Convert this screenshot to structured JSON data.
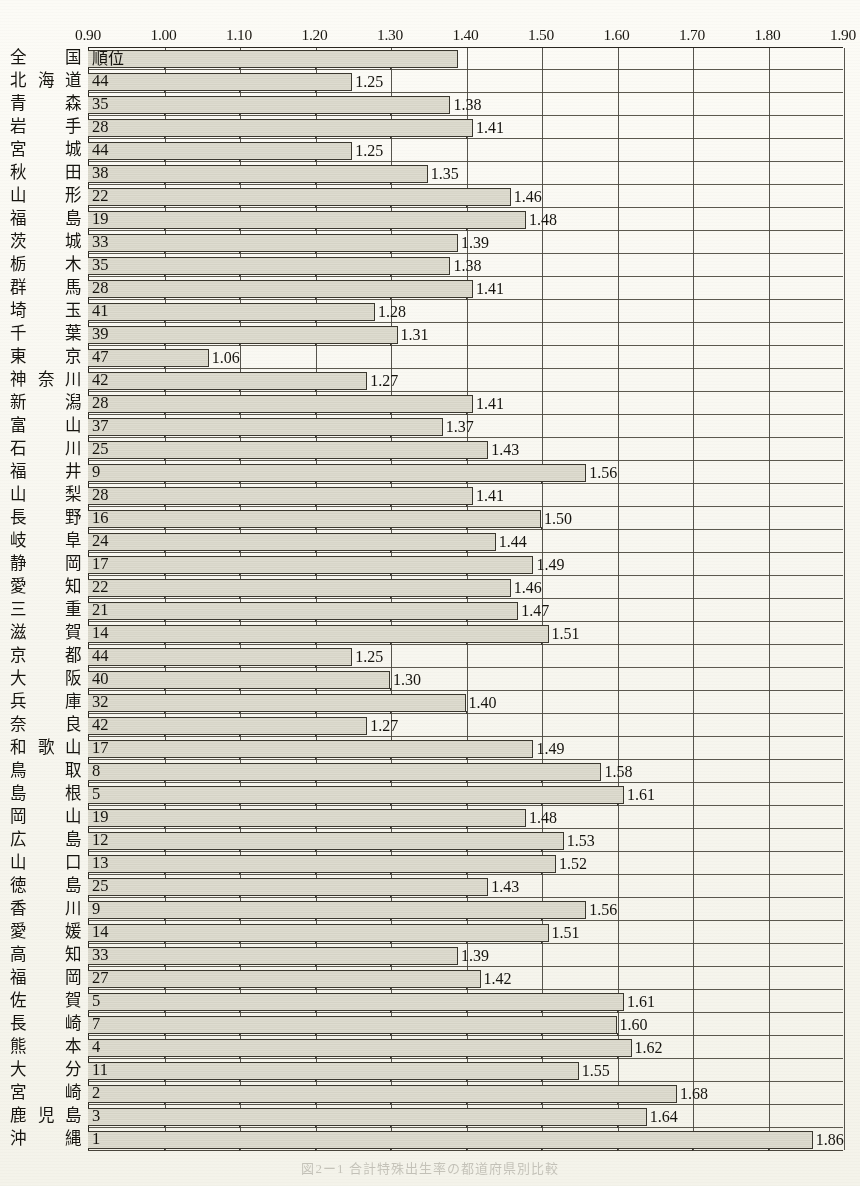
{
  "caption": "図2ー1 合計特殊出生率の都道府県別比較",
  "colors": {
    "bar_fill": "#dcdacd",
    "bar_stroke": "#3b382f",
    "axis": "#2a2720",
    "text": "#16140f",
    "paper": "#f7f6ef"
  },
  "rank_header_label": "順位",
  "chart_data": {
    "type": "bar",
    "orientation": "horizontal",
    "title": "",
    "xlabel": "",
    "ylabel": "",
    "xlim": [
      0.9,
      1.9
    ],
    "xticks": [
      "0.90",
      "1.00",
      "1.10",
      "1.20",
      "1.30",
      "1.40",
      "1.50",
      "1.60",
      "1.70",
      "1.80",
      "1.90"
    ],
    "xtick_values": [
      0.9,
      1.0,
      1.1,
      1.2,
      1.3,
      1.4,
      1.5,
      1.6,
      1.7,
      1.8,
      1.9
    ],
    "grid": true,
    "legend": "none",
    "categories": [
      "全国",
      "北海道",
      "青森",
      "岩手",
      "宮城",
      "秋田",
      "山形",
      "福島",
      "茨城",
      "栃木",
      "群馬",
      "埼玉",
      "千葉",
      "東京",
      "神奈川",
      "新潟",
      "富山",
      "石川",
      "福井",
      "山梨",
      "長野",
      "岐阜",
      "静岡",
      "愛知",
      "三重",
      "滋賀",
      "京都",
      "大阪",
      "兵庫",
      "奈良",
      "和歌山",
      "鳥取",
      "島根",
      "岡山",
      "広島",
      "山口",
      "徳島",
      "香川",
      "愛媛",
      "高知",
      "福岡",
      "佐賀",
      "長崎",
      "熊本",
      "大分",
      "宮崎",
      "鹿児島",
      "沖縄"
    ],
    "values": [
      1.39,
      1.25,
      1.38,
      1.41,
      1.25,
      1.35,
      1.46,
      1.48,
      1.39,
      1.38,
      1.41,
      1.28,
      1.31,
      1.06,
      1.27,
      1.41,
      1.37,
      1.43,
      1.56,
      1.41,
      1.5,
      1.44,
      1.49,
      1.46,
      1.47,
      1.51,
      1.25,
      1.3,
      1.4,
      1.27,
      1.49,
      1.58,
      1.61,
      1.48,
      1.53,
      1.52,
      1.43,
      1.56,
      1.51,
      1.39,
      1.42,
      1.61,
      1.6,
      1.62,
      1.55,
      1.68,
      1.64,
      1.86
    ],
    "ranks": [
      "順位",
      "44",
      "35",
      "28",
      "44",
      "38",
      "22",
      "19",
      "33",
      "35",
      "28",
      "41",
      "39",
      "47",
      "42",
      "28",
      "37",
      "25",
      "9",
      "28",
      "16",
      "24",
      "17",
      "22",
      "21",
      "14",
      "44",
      "40",
      "32",
      "42",
      "17",
      "8",
      "5",
      "19",
      "12",
      "13",
      "25",
      "9",
      "14",
      "33",
      "27",
      "5",
      "7",
      "4",
      "11",
      "2",
      "3",
      "1"
    ],
    "value_labels": [
      "1.39",
      "1.25",
      "1.38",
      "1.41",
      "1.25",
      "1.35",
      "1.46",
      "1.48",
      "1.39",
      "1.38",
      "1.41",
      "1.28",
      "1.31",
      "1.06",
      "1.27",
      "1.41",
      "1.37",
      "1.43",
      "1.56",
      "1.41",
      "1.50",
      "1.44",
      "1.49",
      "1.46",
      "1.47",
      "1.51",
      "1.25",
      "1.30",
      "1.40",
      "1.27",
      "1.49",
      "1.58",
      "1.61",
      "1.48",
      "1.53",
      "1.52",
      "1.43",
      "1.56",
      "1.51",
      "1.39",
      "1.42",
      "1.61",
      "1.60",
      "1.62",
      "1.55",
      "1.68",
      "1.64",
      "1.86"
    ]
  }
}
